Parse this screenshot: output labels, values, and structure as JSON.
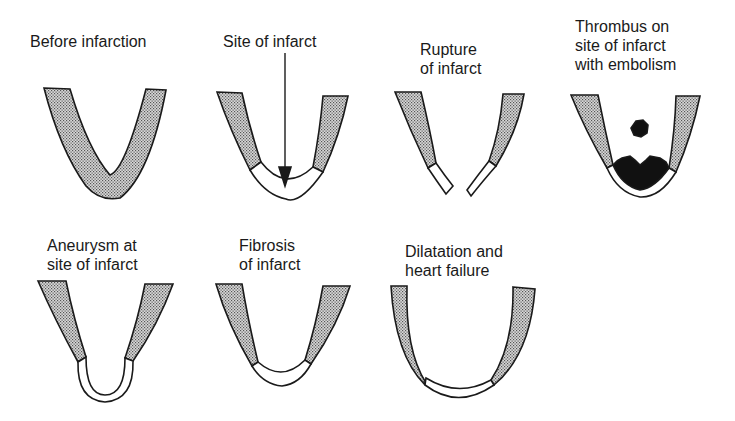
{
  "diagram": {
    "colors": {
      "stroke": "#1a1a1a",
      "healthy_myocardium": "#bdbdbd",
      "infarct": "#ffffff",
      "thrombus": "#111111",
      "background": "#ffffff"
    },
    "panels": [
      {
        "id": "before-infarction",
        "label": "Before infarction"
      },
      {
        "id": "site-of-infarct",
        "label": "Site of infarct"
      },
      {
        "id": "rupture",
        "label": "Rupture\nof infarct"
      },
      {
        "id": "thrombus-embolism",
        "label": "Thrombus on\nsite of infarct\nwith embolism"
      },
      {
        "id": "aneurysm",
        "label": "Aneurysm at\nsite of infarct"
      },
      {
        "id": "fibrosis",
        "label": "Fibrosis\nof infarct"
      },
      {
        "id": "dilatation",
        "label": "Dilatation and\nheart failure"
      }
    ]
  }
}
